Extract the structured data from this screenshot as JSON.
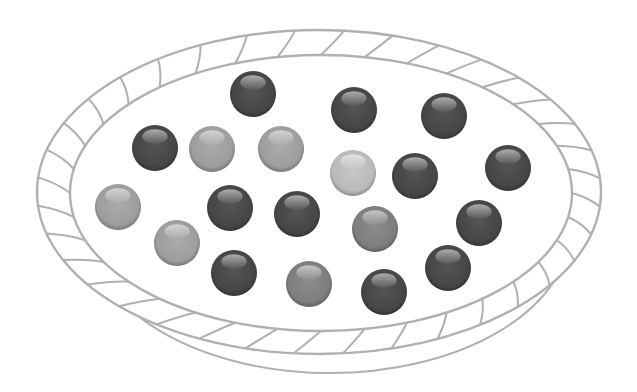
{
  "scene": {
    "description": "Illustration of 19 marbles in shades of gray inside an oval woven basket",
    "basket": {
      "outer": {
        "cx": 319,
        "cy": 192,
        "rx": 282,
        "ry": 162
      },
      "inner": {
        "cx": 321,
        "cy": 193,
        "rx": 251,
        "ry": 138
      },
      "base": {
        "cx": 330,
        "cy": 230,
        "rx": 240,
        "ry": 143
      },
      "stroke_color": "#b0b0b0",
      "weave_count": 36
    },
    "marble_radius": 23,
    "tones": {
      "dark": "#4a4a4a",
      "mid": "#858585",
      "light": "#a6a6a6",
      "lightest": "#c4c4c4"
    },
    "marbles": [
      {
        "x": 253,
        "y": 94,
        "tone": "dark"
      },
      {
        "x": 354,
        "y": 110,
        "tone": "dark"
      },
      {
        "x": 444,
        "y": 116,
        "tone": "dark"
      },
      {
        "x": 155,
        "y": 148,
        "tone": "dark"
      },
      {
        "x": 212,
        "y": 149,
        "tone": "light"
      },
      {
        "x": 281,
        "y": 149,
        "tone": "light"
      },
      {
        "x": 353,
        "y": 173,
        "tone": "lightest"
      },
      {
        "x": 415,
        "y": 176,
        "tone": "dark"
      },
      {
        "x": 508,
        "y": 168,
        "tone": "dark"
      },
      {
        "x": 118,
        "y": 207,
        "tone": "light"
      },
      {
        "x": 230,
        "y": 208,
        "tone": "dark"
      },
      {
        "x": 297,
        "y": 214,
        "tone": "dark"
      },
      {
        "x": 375,
        "y": 229,
        "tone": "mid"
      },
      {
        "x": 479,
        "y": 223,
        "tone": "dark"
      },
      {
        "x": 177,
        "y": 243,
        "tone": "light"
      },
      {
        "x": 234,
        "y": 273,
        "tone": "dark"
      },
      {
        "x": 309,
        "y": 284,
        "tone": "mid"
      },
      {
        "x": 384,
        "y": 292,
        "tone": "dark"
      },
      {
        "x": 448,
        "y": 268,
        "tone": "dark"
      }
    ],
    "counts": {
      "total": 19,
      "dark": 12,
      "mid": 2,
      "light": 4,
      "lightest": 1
    }
  }
}
